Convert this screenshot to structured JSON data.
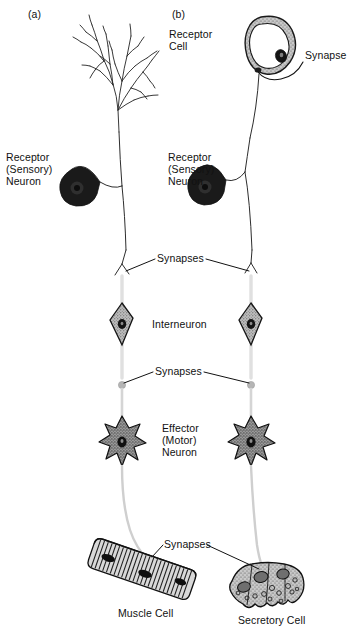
{
  "figure": {
    "background_color": "#ffffff",
    "ink_color": "#111111",
    "pale_axon_color": "#d9d9d9",
    "cell_fill_gray": "#b0b0b0",
    "soma_fill_black": "#1a1a1a"
  },
  "panels": [
    {
      "tag": "(a)",
      "name": "panel-a"
    },
    {
      "tag": "(b)",
      "name": "panel-b"
    }
  ],
  "labels": {
    "panel_a_tag": "(a)",
    "panel_b_tag": "(b)",
    "receptor_cell": "Receptor\nCell",
    "synapse_singular": "Synapse",
    "receptor_neuron_a": "Receptor\n(Sensory)\nNeuron",
    "receptor_neuron_b": "Receptor\n(Sensory)\nNeuron",
    "synapses_upper": "Synapses",
    "interneuron": "Interneuron",
    "synapses_middle": "Synapses",
    "effector_neuron": "Effector\n(Motor)\nNeuron",
    "synapses_lower": "Synapses",
    "muscle_cell": "Muscle Cell",
    "secretory_cell": "Secretory Cell"
  },
  "structures": {
    "dendritic_tree": {
      "name": "dendritic-tree",
      "panel": "a",
      "description": "Branching free nerve ending / dendritic arbor at top of panel a"
    },
    "receptor_cell_ring": {
      "name": "receptor-cell",
      "panel": "b",
      "description": "Oval receptor cell with stippled membrane and dark nucleus"
    },
    "sensory_soma_a": {
      "name": "receptor-sensory-neuron-soma-a",
      "description": "Solid black round soma with axon hillock tail"
    },
    "sensory_soma_b": {
      "name": "receptor-sensory-neuron-soma-b",
      "description": "Solid black round soma with axon hillock tail"
    },
    "interneuron_a": {
      "name": "interneuron-a",
      "description": "Small four-pointed stellate cell with dark nucleus"
    },
    "interneuron_b": {
      "name": "interneuron-b",
      "description": "Small four-pointed stellate cell with dark nucleus"
    },
    "effector_neuron_a": {
      "name": "effector-motor-neuron-a",
      "description": "Multipolar star-shaped motor neuron, stippled cytoplasm"
    },
    "effector_neuron_b": {
      "name": "effector-motor-neuron-b",
      "description": "Multipolar star-shaped motor neuron, stippled cytoplasm"
    },
    "muscle_cell": {
      "name": "muscle-cell",
      "description": "Elongated striated muscle fiber angled diagonally"
    },
    "secretory_cell": {
      "name": "secretory-cell",
      "description": "Cluster of stippled glandular cells containing secretory vesicles"
    }
  },
  "pathway_a": [
    "dendritic-tree",
    "receptor-sensory-neuron-soma-a",
    "synapse",
    "interneuron-a",
    "synapse",
    "effector-motor-neuron-a",
    "synapse",
    "muscle-cell"
  ],
  "pathway_b": [
    "receptor-cell",
    "synapse",
    "receptor-sensory-neuron-soma-b",
    "synapse",
    "interneuron-b",
    "synapse",
    "effector-motor-neuron-b",
    "synapse",
    "secretory-cell"
  ]
}
